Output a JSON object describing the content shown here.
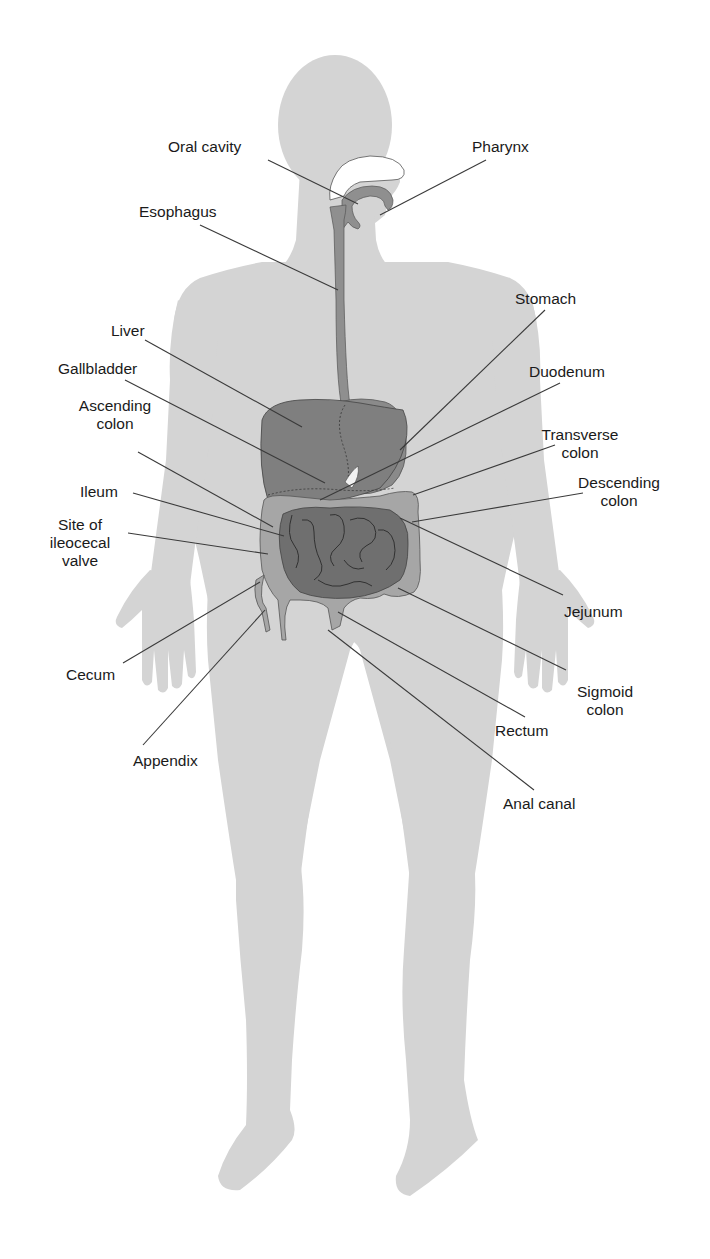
{
  "colors": {
    "background": "#ffffff",
    "body_silhouette": "#d4d4d4",
    "organ_dark": "#7a7a7a",
    "organ_medium": "#8f8f8f",
    "colon_light": "#a6a6a6",
    "nasal_cavity": "#ffffff",
    "leader_line": "#3a3a3a",
    "text": "#1a1a1a"
  },
  "labels": {
    "oral_cavity": "Oral cavity",
    "pharynx": "Pharynx",
    "esophagus": "Esophagus",
    "stomach": "Stomach",
    "liver": "Liver",
    "gallbladder": "Gallbladder",
    "duodenum": "Duodenum",
    "ascending_colon": "Ascending\ncolon",
    "transverse_colon": "Transverse\ncolon",
    "ileum": "Ileum",
    "descending_colon": "Descending\ncolon",
    "ileocecal_valve": "Site of\nileocecal\nvalve",
    "jejunum": "Jejunum",
    "cecum": "Cecum",
    "sigmoid_colon": "Sigmoid\ncolon",
    "appendix": "Appendix",
    "rectum": "Rectum",
    "anal_canal": "Anal canal"
  }
}
